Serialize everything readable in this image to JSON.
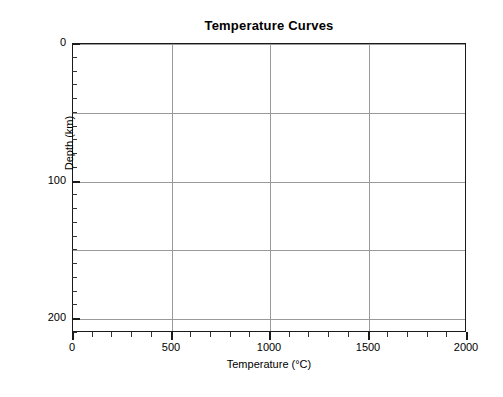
{
  "chart_data": {
    "type": "line",
    "title": "Temperature Curves",
    "xlabel": "Temperature (°C)",
    "ylabel": "Depth (km)",
    "xlim": [
      0,
      2000
    ],
    "ylim": [
      210,
      0
    ],
    "y_inverted": true,
    "grid": true,
    "legend": "none",
    "series": [],
    "x_ticks": [
      {
        "value": 0,
        "label": "0"
      },
      {
        "value": 500,
        "label": "500"
      },
      {
        "value": 1000,
        "label": "1000"
      },
      {
        "value": 1500,
        "label": "1500"
      },
      {
        "value": 2000,
        "label": "2000"
      }
    ],
    "x_minor_step": 100,
    "y_ticks": [
      {
        "value": 0,
        "label": "0"
      },
      {
        "value": 100,
        "label": "100"
      },
      {
        "value": 200,
        "label": "200"
      }
    ],
    "y_gridline_values": [
      0,
      50,
      100,
      150,
      200
    ],
    "y_minor_step": 10,
    "colors": {
      "frame": "#1a1a1a",
      "grid": "#9a9a9a",
      "background": "#ffffff",
      "text": "#000000"
    },
    "note": "Empty plotting frame — no data curves are drawn."
  }
}
